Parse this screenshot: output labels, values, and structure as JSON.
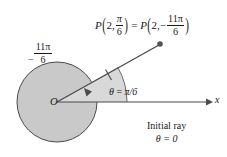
{
  "figure": {
    "background_color": "#ffffff",
    "ink_color": "#3a3a3a",
    "circle_fill": "#c9c9c9",
    "wedge_fill": "#d9d9d9"
  },
  "labels": {
    "point": {
      "P": "P",
      "open_paren": "(",
      "close_paren": ")",
      "radius": "2",
      "comma": ",",
      "angle_num": "π",
      "angle_den": "6",
      "equals": "=",
      "neg_sign": "−",
      "neg_angle_num": "11π",
      "neg_angle_den": "6",
      "full_text": "P(2, π/6) = P(2, −11π/6)"
    },
    "theta": {
      "symbol": "θ",
      "equals": "=",
      "value": "π/6",
      "full_text": "θ = π/6"
    },
    "negative_angle": {
      "sign": "−",
      "numerator": "11π",
      "denominator": "6",
      "full_text": "−11π/6"
    },
    "initial_ray": {
      "line1": "Initial ray",
      "line2": "θ = 0"
    },
    "origin": "O",
    "x_axis": "x"
  },
  "geometry": {
    "origin_x": 57,
    "origin_y": 102,
    "circle_radius": 40,
    "point_x": 160,
    "point_y": 44,
    "theta_degrees": 30,
    "radius_value": 2,
    "x_axis_end": 212
  }
}
